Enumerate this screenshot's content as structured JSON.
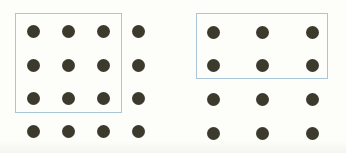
{
  "figure": {
    "background_color": "#fdfdfa",
    "dot_color": "#3b3a2d",
    "dot_diameter_px": 13,
    "rect_border_color": "#a9c5d8",
    "rect_border_width_px": 1.5,
    "groups": [
      {
        "name": "left-array",
        "grid_cols": 4,
        "grid_rows": 4,
        "total_dots": 16,
        "columns_x": [
          33,
          68,
          103,
          138
        ],
        "rows_y": [
          31,
          65,
          98,
          131
        ],
        "highlight": {
          "x": 15,
          "y": 13,
          "width": 107,
          "height": 100,
          "enclosed_cols": 3,
          "enclosed_rows": 3,
          "enclosed_dots": 9
        }
      },
      {
        "name": "right-array",
        "grid_cols": 3,
        "grid_rows": 4,
        "total_dots": 12,
        "columns_x": [
          213,
          262,
          312
        ],
        "rows_y": [
          32,
          65,
          99,
          133
        ],
        "highlight": {
          "x": 196,
          "y": 13,
          "width": 132,
          "height": 66,
          "enclosed_cols": 3,
          "enclosed_rows": 2,
          "enclosed_dots": 6
        }
      }
    ]
  }
}
